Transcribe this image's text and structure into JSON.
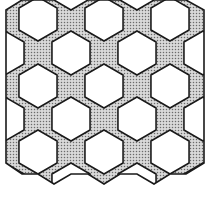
{
  "figure": {
    "width": 208,
    "height": 197,
    "colors": {
      "background": "#ffffff",
      "hexagon_fill": "#ffffff",
      "star_fill_base": "#d9d9d9",
      "stipple_dot": "#6b6b6b",
      "stroke": "#1a1a1a"
    },
    "stroke_width": 1.6,
    "hexagon_radius": 22,
    "hexagons": [
      {
        "cx": 38,
        "cy": 19
      },
      {
        "cx": 104,
        "cy": 19
      },
      {
        "cx": 170,
        "cy": 19
      },
      {
        "cx": 5,
        "cy": 53
      },
      {
        "cx": 71,
        "cy": 53
      },
      {
        "cx": 137,
        "cy": 53
      },
      {
        "cx": 203,
        "cy": 53
      },
      {
        "cx": 38,
        "cy": 86
      },
      {
        "cx": 104,
        "cy": 86
      },
      {
        "cx": 170,
        "cy": 86
      },
      {
        "cx": 5,
        "cy": 119
      },
      {
        "cx": 71,
        "cy": 119
      },
      {
        "cx": 137,
        "cy": 119
      },
      {
        "cx": 203,
        "cy": 119
      },
      {
        "cx": 38,
        "cy": 152
      },
      {
        "cx": 104,
        "cy": 152
      },
      {
        "cx": 170,
        "cy": 152
      },
      {
        "cx": 5,
        "cy": 185
      },
      {
        "cx": 71,
        "cy": 185
      },
      {
        "cx": 137,
        "cy": 185
      },
      {
        "cx": 203,
        "cy": 185
      }
    ],
    "outline": "6,10 22,0 54,0 71,10 88,0 120,0 137,10 154,0 186,0 204,10 204,163 186,174 170,174 154,184 137,174 120,174 104,184 88,174 71,174 54,184 38,174 22,174 6,163"
  }
}
